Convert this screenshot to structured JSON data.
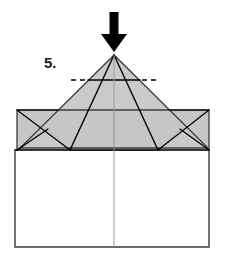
{
  "diagram": {
    "step_label": "5.",
    "step_number": 5,
    "instruction_icon": "down-arrow-icon",
    "instruction_meaning": "push / fold down at apex",
    "canvas": {
      "width": 226,
      "height": 263
    },
    "colors": {
      "paper_front": "#c6c6c6",
      "paper_back": "#ffffff",
      "fold_line": "#000000",
      "outline": "#3a3a3a",
      "arrow": "#000000",
      "soft_line": "#9a9a9a",
      "background": "#ffffff"
    },
    "arrow": {
      "name": "push-down-arrow",
      "direction": "down",
      "tip_x": 114,
      "tip_y": 52,
      "tail_y": 12,
      "shaft_width": 9,
      "head_width": 26,
      "head_height": 18
    },
    "label_position": {
      "x": 44,
      "y": 68
    },
    "shapes": {
      "base_rectangle": {
        "name": "base-rectangle",
        "fill": "paper_back",
        "points": "15,150 209,150 209,247 15,247"
      },
      "left_wing": {
        "name": "left-wing-flap",
        "fill": "paper_front",
        "points": "17,110 114,110 114,150 70,150 48,129 17,150"
      },
      "right_wing": {
        "name": "right-wing-flap",
        "fill": "paper_front",
        "points": "209,110 114,110 114,150 158,150 180,129 209,150"
      },
      "center_triangle": {
        "name": "center-triangle",
        "fill": "paper_front",
        "points": "114,55 20,148 208,148"
      }
    },
    "fold_lines": [
      {
        "name": "fold-apex-to-left-notch",
        "style": "solid",
        "points": "114,55 70,150"
      },
      {
        "name": "fold-apex-to-right-notch",
        "style": "solid",
        "points": "114,55 158,150"
      },
      {
        "name": "fold-horizontal-crease",
        "style": "solid",
        "points": "88,80 140,80"
      },
      {
        "name": "fold-horizontal-crease-dash-left",
        "style": "dashed",
        "points": "71,80 86,80"
      },
      {
        "name": "fold-horizontal-crease-dash-right",
        "style": "dashed",
        "points": "142,80 157,80"
      },
      {
        "name": "fold-center-vertical",
        "style": "solid-soft",
        "points": "114,55 114,247"
      },
      {
        "name": "fold-wing-top-edge",
        "style": "solid",
        "points": "17,110 209,110"
      },
      {
        "name": "fold-left-wing-inner-diagonal",
        "style": "solid",
        "points": "17,110 70,150"
      },
      {
        "name": "fold-right-wing-inner-diagonal",
        "style": "solid",
        "points": "209,110 158,150"
      },
      {
        "name": "fold-left-wing-lower-diagonal",
        "style": "solid",
        "points": "17,150 48,129"
      },
      {
        "name": "fold-right-wing-lower-diagonal",
        "style": "solid",
        "points": "209,150 180,129"
      },
      {
        "name": "fold-triangle-left-edge",
        "style": "solid",
        "points": "114,55 20,148"
      },
      {
        "name": "fold-triangle-right-edge",
        "style": "solid",
        "points": "114,55 208,148"
      },
      {
        "name": "fold-baseline",
        "style": "solid",
        "points": "15,150 209,150"
      }
    ]
  }
}
